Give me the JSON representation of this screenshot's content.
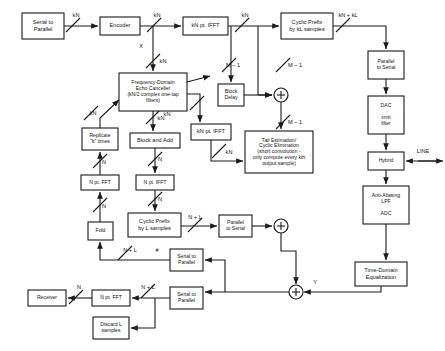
{
  "diagram": {
    "blocks": [
      {
        "id": "serial-to-parallel-tx",
        "label": "Serial to\nParallel",
        "x": 22,
        "y": 13,
        "w": 42,
        "h": 26
      },
      {
        "id": "encoder",
        "label": "Encoder",
        "x": 100,
        "y": 17,
        "w": 40,
        "h": 18
      },
      {
        "id": "kn-pt-ifft-top",
        "label": "kN pt. IFFT",
        "x": 183,
        "y": 17,
        "w": 45,
        "h": 18
      },
      {
        "id": "cyclic-prefix-kl",
        "label": "Cyclic Prefix\nby kL samples",
        "x": 281,
        "y": 13,
        "w": 52,
        "h": 26
      },
      {
        "id": "parallel-to-serial-tx",
        "label": "Parallel\nto Serial",
        "x": 368,
        "y": 51,
        "w": 36,
        "h": 28
      },
      {
        "id": "dac-xmit-filter",
        "label": "DAC\n\nxmit\nfilter",
        "x": 368,
        "y": 96,
        "w": 36,
        "h": 38
      },
      {
        "id": "hybrid",
        "label": "Hybrid",
        "x": 368,
        "y": 152,
        "w": 36,
        "h": 18
      },
      {
        "id": "anti-aliasing-adc",
        "label": "Anti-Aliasing\nLPF\n\nADC",
        "x": 363,
        "y": 186,
        "w": 46,
        "h": 38
      },
      {
        "id": "time-domain-equalization",
        "label": "Time-Domain\nEqualization",
        "x": 355,
        "y": 262,
        "w": 52,
        "h": 24
      },
      {
        "id": "frequency-domain-echo-canceller",
        "label": "Frequency-Domain\nEcho Canceller\n(kN/2 complex one-tap\nfilters)",
        "x": 119,
        "y": 73,
        "w": 68,
        "h": 38
      },
      {
        "id": "block-delay",
        "label": "Block\nDelay",
        "x": 218,
        "y": 84,
        "w": 26,
        "h": 22
      },
      {
        "id": "kn-pt-ifft-mid",
        "label": "kN pt. IFFT",
        "x": 191,
        "y": 124,
        "w": 40,
        "h": 16
      },
      {
        "id": "tail-estimation",
        "label": "Tail Estimation/\nCyclic Elimination\n(short convolution -\nonly compute every kth\noutput sample)",
        "x": 245,
        "y": 131,
        "w": 68,
        "h": 42
      },
      {
        "id": "replicate-k-times",
        "label": "Replicate\n\"k\" times",
        "x": 82,
        "y": 128,
        "w": 36,
        "h": 22
      },
      {
        "id": "block-and-add",
        "label": "Block and Add",
        "x": 130,
        "y": 133,
        "w": 50,
        "h": 15
      },
      {
        "id": "n-pt-fft-left",
        "label": "N pt. FFT",
        "x": 81,
        "y": 175,
        "w": 38,
        "h": 15
      },
      {
        "id": "n-pt-ifft-mid",
        "label": "N pt. IFFT",
        "x": 136,
        "y": 175,
        "w": 38,
        "h": 15
      },
      {
        "id": "fold",
        "label": "Fold",
        "x": 88,
        "y": 222,
        "w": 25,
        "h": 18
      },
      {
        "id": "cyclic-prefix-l",
        "label": "Cyclic Prefix\nby L samples",
        "x": 128,
        "y": 213,
        "w": 53,
        "h": 24
      },
      {
        "id": "parallel-to-serial-rx",
        "label": "Parallel\nto Serial",
        "x": 219,
        "y": 215,
        "w": 33,
        "h": 22
      },
      {
        "id": "serial-to-parallel-upper",
        "label": "Serial to\nParallel",
        "x": 170,
        "y": 249,
        "w": 33,
        "h": 22
      },
      {
        "id": "serial-to-parallel-lower",
        "label": "Serial to\nParallel",
        "x": 170,
        "y": 287,
        "w": 33,
        "h": 22
      },
      {
        "id": "n-pt-fft-rx",
        "label": "N pt. FFT",
        "x": 92,
        "y": 290,
        "w": 38,
        "h": 16
      },
      {
        "id": "receiver",
        "label": "Receiver",
        "x": 28,
        "y": 290,
        "w": 38,
        "h": 16
      },
      {
        "id": "discard-l-samples",
        "label": "Discard L\nsamples",
        "x": 93,
        "y": 317,
        "w": 36,
        "h": 22
      }
    ],
    "summing_junctions": [
      {
        "id": "summer-tx",
        "cx": 281,
        "cy": 95,
        "r": 7
      },
      {
        "id": "summer-mid",
        "cx": 281,
        "cy": 226,
        "r": 7
      },
      {
        "id": "summer-rx",
        "cx": 296,
        "cy": 292,
        "r": 7
      }
    ],
    "signal_labels": [
      {
        "id": "label-kn-1",
        "text": "kN",
        "x": 76,
        "y": 16
      },
      {
        "id": "label-kn-2",
        "text": "kN",
        "x": 157,
        "y": 16
      },
      {
        "id": "label-kn-3",
        "text": "kN",
        "x": 245,
        "y": 16
      },
      {
        "id": "label-kn-kl",
        "text": "kN + kL",
        "x": 348,
        "y": 16
      },
      {
        "id": "label-x",
        "text": "X",
        "x": 141,
        "y": 47
      },
      {
        "id": "label-kn-x",
        "text": "kN",
        "x": 163,
        "y": 62
      },
      {
        "id": "label-m-1-a",
        "text": "M – 1",
        "x": 233,
        "y": 66
      },
      {
        "id": "label-m-1-b",
        "text": "M – 1",
        "x": 295,
        "y": 66
      },
      {
        "id": "label-m-1-c",
        "text": "M – 1",
        "x": 295,
        "y": 123
      },
      {
        "id": "label-kn-ec-out",
        "text": "kN",
        "x": 167,
        "y": 115
      },
      {
        "id": "label-kn-repl",
        "text": "kN",
        "x": 93,
        "y": 114
      },
      {
        "id": "label-kn-ba",
        "text": "kN",
        "x": 161,
        "y": 119
      },
      {
        "id": "label-kn-tail",
        "text": "kN",
        "x": 229,
        "y": 153
      },
      {
        "id": "label-n-fft-left",
        "text": "N",
        "x": 104,
        "y": 163
      },
      {
        "id": "label-n-ba",
        "text": "N",
        "x": 160,
        "y": 160
      },
      {
        "id": "label-n-fold",
        "text": "N",
        "x": 104,
        "y": 207
      },
      {
        "id": "label-n-ifft",
        "text": "N",
        "x": 160,
        "y": 200
      },
      {
        "id": "label-n-l-1",
        "text": "N + L",
        "x": 195,
        "y": 218
      },
      {
        "id": "label-n-l-2",
        "text": "N + L",
        "x": 130,
        "y": 251
      },
      {
        "id": "label-hash",
        "text": "#",
        "x": 157,
        "y": 251
      },
      {
        "id": "label-n-l-3",
        "text": "N + L",
        "x": 148,
        "y": 288
      },
      {
        "id": "label-n-rx",
        "text": "N",
        "x": 79,
        "y": 288
      },
      {
        "id": "label-line",
        "text": "LINE",
        "x": 423,
        "y": 152
      },
      {
        "id": "label-y",
        "text": "Y",
        "x": 315,
        "y": 283
      }
    ]
  }
}
